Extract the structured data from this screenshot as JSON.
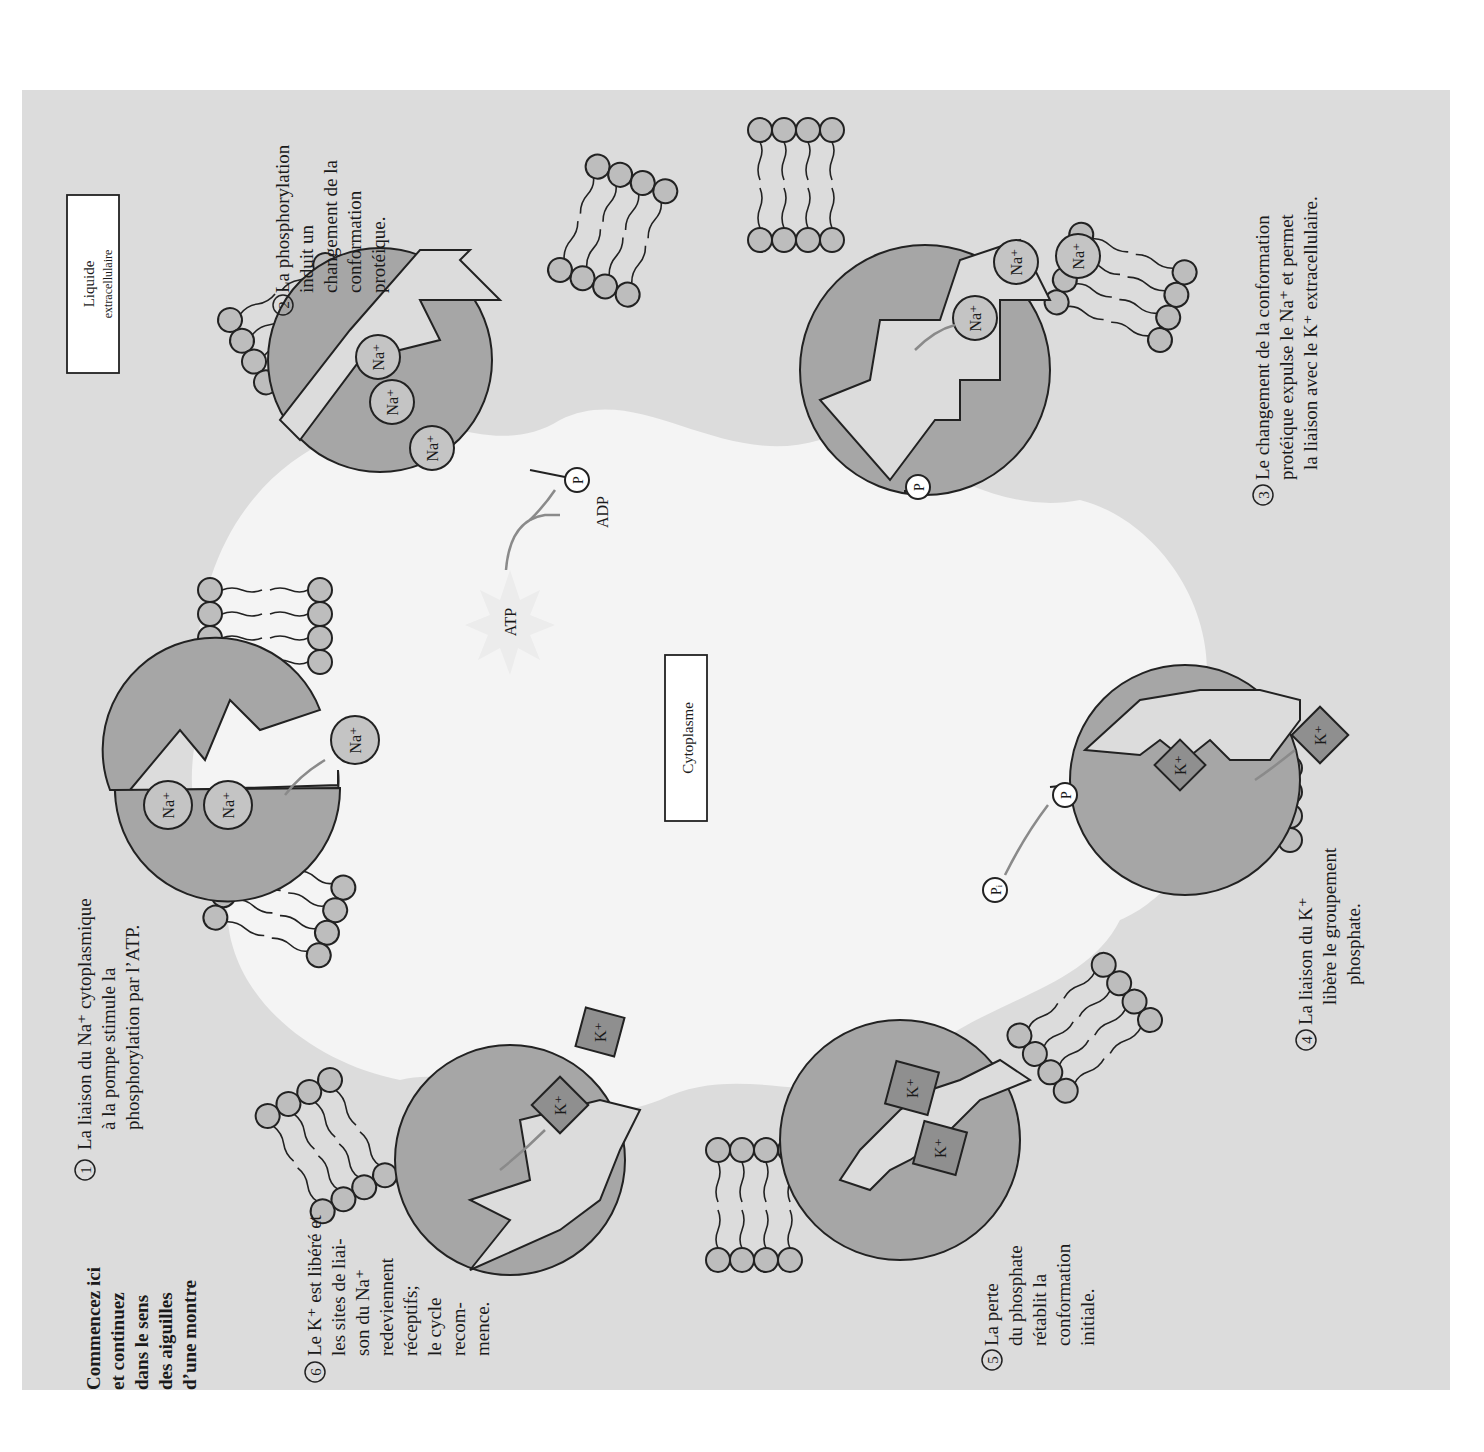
{
  "figure": {
    "orientation": "rotated 90° counter-clockwise",
    "regions": {
      "extracellular_label_line1": "Liquide",
      "extracellular_label_line2": "extracellulaire",
      "cytoplasm_label": "Cytoplasme"
    },
    "intro": [
      "Commencez ici",
      "et continuez",
      "dans le sens",
      "des aiguilles",
      "d’une montre"
    ],
    "steps": [
      {
        "number": "1",
        "lines": [
          "La liaison du Na⁺ cytoplasmique",
          "à la pompe stimule la",
          "phosphorylation par l’ATP."
        ]
      },
      {
        "number": "2",
        "lines": [
          "La phosphorylation",
          "induit un",
          "changement de la",
          "conformation",
          "protéique."
        ]
      },
      {
        "number": "3",
        "lines": [
          "Le changement de la conformation",
          "protéique expulse le Na⁺ et permet",
          "la liaison avec le K⁺ extracellulaire."
        ]
      },
      {
        "number": "4",
        "lines": [
          "La liaison du K⁺",
          "libère le groupement",
          "phosphate."
        ]
      },
      {
        "number": "5",
        "lines": [
          "La perte",
          "du phosphate",
          "rétablit la",
          "conformation",
          "initiale."
        ]
      },
      {
        "number": "6",
        "lines": [
          "Le K⁺ est libéré et",
          "les sites de liai-",
          "son du Na⁺",
          "redeviennent",
          "réceptifs;",
          "le cycle",
          "recom-",
          "mence."
        ]
      }
    ],
    "ions": {
      "sodium": "Na⁺",
      "potassium": "K⁺"
    },
    "molecules": {
      "atp": "ATP",
      "adp": "ADP",
      "phosphate": "P",
      "inorganic_phosphate": "Pᵢ"
    },
    "colors": {
      "panel": "#dcdcdc",
      "cytoplasm": "#f4f4f4",
      "pump": "#a6a6a6",
      "sodium_ion": "#c4c4c4",
      "potassium_ion": "#8f8f8f",
      "arrow": "#8a8a8a"
    }
  }
}
